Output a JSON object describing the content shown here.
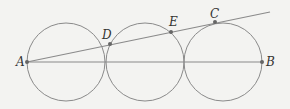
{
  "diagram": {
    "points": {
      "A": {
        "label": "A",
        "x": 27,
        "y": 62
      },
      "B": {
        "label": "B",
        "x": 262,
        "y": 62
      },
      "C": {
        "label": "C",
        "x": 215,
        "y": 22
      },
      "D": {
        "label": "D",
        "x": 110,
        "y": 44
      },
      "E": {
        "label": "E",
        "x": 171,
        "y": 32
      }
    },
    "circles": [
      {
        "cx": 66,
        "cy": 62,
        "r": 39
      },
      {
        "cx": 145,
        "cy": 62,
        "r": 39
      },
      {
        "cx": 223,
        "cy": 62,
        "r": 39
      }
    ],
    "line_color": "#8a8a8a"
  }
}
